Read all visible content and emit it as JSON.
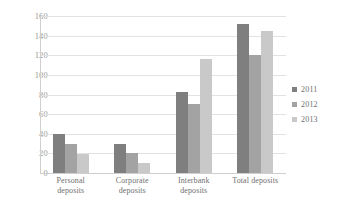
{
  "chart_data": {
    "type": "bar",
    "title": "",
    "xlabel": "",
    "ylabel": "",
    "ylim": [
      0,
      160
    ],
    "yticks": [
      "160",
      "140",
      "120",
      "100",
      "80",
      "60",
      "40",
      "20",
      "0"
    ],
    "grid": "horizontal",
    "legend_position": "right",
    "categories": [
      "Personal\ndeposits",
      "Corporate\ndeposits",
      "Interbank\ndeposits",
      "Total deposits"
    ],
    "category_lines": [
      [
        "Personal",
        "deposits"
      ],
      [
        "Corporate",
        "deposits"
      ],
      [
        "Interbank",
        "deposits"
      ],
      [
        "Total deposits",
        ""
      ]
    ],
    "series": [
      {
        "name": "2011",
        "color": "#7f7f7f",
        "values": [
          40,
          30,
          83,
          152
        ]
      },
      {
        "name": "2012",
        "color": "#a3a3a3",
        "values": [
          30,
          20,
          70,
          120
        ]
      },
      {
        "name": "2013",
        "color": "#c9c9c9",
        "values": [
          19,
          10,
          116,
          145
        ]
      }
    ]
  },
  "legend": {
    "items": [
      {
        "label": "2011",
        "color": "#7f7f7f"
      },
      {
        "label": "2012",
        "color": "#a3a3a3"
      },
      {
        "label": "2013",
        "color": "#c9c9c9"
      }
    ]
  },
  "colors": {
    "series_2011": "#7f7f7f",
    "series_2012": "#a3a3a3",
    "series_2013": "#c9c9c9",
    "gridline": "#e2e2e2",
    "axis": "#cfcfcf",
    "tick_text": "#9a9a9a",
    "category_text": "#6f6f6f",
    "background": "#ffffff"
  }
}
